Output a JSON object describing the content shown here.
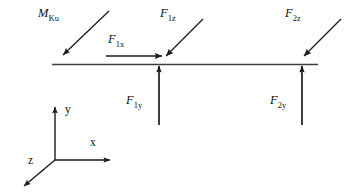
{
  "figure": {
    "type": "free-body-diagram",
    "title": "",
    "background_color": "#ffffff",
    "stroke_color": "#1a1a1a",
    "text_color": "#111111"
  },
  "labels": {
    "moment": {
      "base": "M",
      "sub": "Ku"
    },
    "force_1x": {
      "base": "F",
      "sub": "1x"
    },
    "force_1z": {
      "base": "F",
      "sub": "1z"
    },
    "force_1y": {
      "base": "F",
      "sub": "1y"
    },
    "force_2z": {
      "base": "F",
      "sub": "2z"
    },
    "force_2y": {
      "base": "F",
      "sub": "2y"
    }
  },
  "axes": {
    "x_label": "x",
    "y_label": "y",
    "z_label": "z"
  },
  "geometry": {
    "beam": {
      "x1": 52,
      "y1": 64,
      "x2": 318,
      "y2": 64
    },
    "node_1": {
      "x": 159,
      "y": 64
    },
    "node_2": {
      "x": 302,
      "y": 64
    },
    "arrows": [
      {
        "name": "moment-arrow",
        "x1": 109,
        "y1": 11,
        "x2": 62,
        "y2": 56
      },
      {
        "name": "force-1x-arrow",
        "x1": 106,
        "y1": 56,
        "x2": 163,
        "y2": 56
      },
      {
        "name": "force-1z-arrow",
        "x1": 203,
        "y1": 19,
        "x2": 165,
        "y2": 57
      },
      {
        "name": "force-1y-arrow",
        "x1": 159,
        "y1": 125,
        "x2": 159,
        "y2": 66
      },
      {
        "name": "force-2z-arrow",
        "x1": 341,
        "y1": 19,
        "x2": 303,
        "y2": 57
      },
      {
        "name": "force-2y-arrow",
        "x1": 302,
        "y1": 125,
        "x2": 302,
        "y2": 66
      }
    ],
    "axis_triad": {
      "origin": {
        "x": 55,
        "y": 160
      },
      "y_tip": {
        "x": 55,
        "y": 105
      },
      "x_tip": {
        "x": 112,
        "y": 160
      },
      "z_tip": {
        "x": 22,
        "y": 188
      }
    }
  }
}
